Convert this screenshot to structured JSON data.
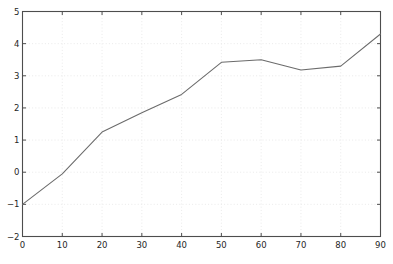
{
  "chart_data": {
    "type": "line",
    "title": "",
    "subtitle": "",
    "xlabel": "",
    "ylabel": "",
    "x": [
      0,
      10,
      20,
      30,
      40,
      50,
      60,
      70,
      80,
      90
    ],
    "values": [
      -1.0,
      -0.05,
      1.25,
      1.85,
      2.42,
      3.42,
      3.5,
      3.18,
      3.3,
      4.3
    ],
    "series": [
      {
        "name": "",
        "values": [
          -1.0,
          -0.05,
          1.25,
          1.85,
          2.42,
          3.42,
          3.5,
          3.18,
          3.3,
          4.3
        ]
      }
    ],
    "xlim": [
      0,
      90
    ],
    "ylim": [
      -2,
      5
    ],
    "xticks": [
      0,
      10,
      20,
      30,
      40,
      50,
      60,
      70,
      80,
      90
    ],
    "yticks": [
      -2,
      -1,
      0,
      1,
      2,
      3,
      4,
      5
    ],
    "xtick_labels": [
      "0",
      "10",
      "20",
      "30",
      "40",
      "50",
      "60",
      "70",
      "80",
      "90"
    ],
    "ytick_labels": [
      "−2",
      "−1",
      "0",
      "1",
      "2",
      "3",
      "4",
      "5"
    ],
    "grid": true,
    "legend": false,
    "legend_position": "none",
    "annotations": [],
    "colors": {
      "line": "#6b6b6b",
      "grid": "#e8e8e8",
      "axis": "#4d4d4d",
      "background": "#ffffff",
      "tick_text": "#262626"
    }
  }
}
